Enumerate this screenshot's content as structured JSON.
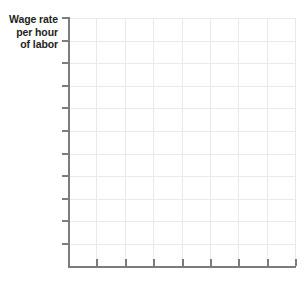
{
  "figure": {
    "name": "empty-graph-grid",
    "background_color": "#ffffff"
  },
  "axis_title": {
    "line1": "Wage rate",
    "line2": "per hour",
    "line3": "of labor",
    "color": "#231f20",
    "align": "right",
    "bold": true
  },
  "chart_data": {
    "type": "line",
    "title": "",
    "subtitle": "",
    "xlabel": "",
    "ylabel": "Wage rate per hour of labor",
    "series": [],
    "categories": [],
    "x": [],
    "values": [],
    "annotations": [],
    "legend": [],
    "legend_position": "none",
    "grid": true,
    "grid_color": "#e9e9e9",
    "axis_color": "#7c7c7c",
    "blank": true,
    "note": "Empty graph template with no plotted data",
    "x_tick_count": 8,
    "y_tick_count": 11,
    "x_gridline_count": 8,
    "y_gridline_count": 11,
    "x_tick_labels": [],
    "y_tick_labels": [],
    "xlim": [
      0,
      8
    ],
    "ylim": [
      0,
      11
    ]
  },
  "geometry": {
    "plot_left": 68,
    "plot_top": 18,
    "plot_width": 227,
    "plot_height": 248,
    "y_tick_positions": [
      0,
      22.6,
      45.2,
      67.8,
      90.4,
      113.0,
      135.6,
      158.2,
      180.8,
      203.4,
      226.0
    ],
    "x_tick_positions": [
      28.4,
      56.8,
      85.2,
      113.6,
      142.0,
      170.4,
      198.8,
      227.0
    ]
  }
}
